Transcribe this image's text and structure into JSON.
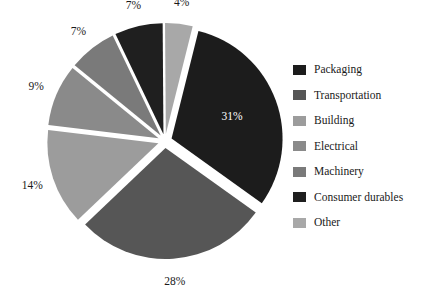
{
  "chart_data": {
    "type": "pie",
    "title": "",
    "subtitle": "",
    "xlabel": "",
    "ylabel": "",
    "legend_position": "right",
    "grid": false,
    "exploded": true,
    "background": "#ffffff",
    "categories": [
      "Packaging",
      "Transportation",
      "Building",
      "Electrical",
      "Machinery",
      "Consumer durables",
      "Other"
    ],
    "values": [
      31,
      28,
      14,
      9,
      7,
      7,
      4
    ],
    "value_unit": "%",
    "data_labels": [
      "31%",
      "28%",
      "14%",
      "9%",
      "7%",
      "7%",
      "4%"
    ],
    "colors": [
      "#1c1c1c",
      "#565656",
      "#9c9c9c",
      "#8a8a8a",
      "#7a7a7a",
      "#1f1f1f",
      "#a8a8a8"
    ],
    "slices": [
      {
        "label": "Packaging",
        "value": 31,
        "display": "31%",
        "color": "#1c1c1c",
        "label_inside": true
      },
      {
        "label": "Transportation",
        "value": 28,
        "display": "28%",
        "color": "#565656",
        "label_inside": false
      },
      {
        "label": "Building",
        "value": 14,
        "display": "14%",
        "color": "#9c9c9c",
        "label_inside": false
      },
      {
        "label": "Electrical",
        "value": 9,
        "display": "9%",
        "color": "#8a8a8a",
        "label_inside": false
      },
      {
        "label": "Machinery",
        "value": 7,
        "display": "7%",
        "color": "#7a7a7a",
        "label_inside": false
      },
      {
        "label": "Consumer durables",
        "value": 7,
        "display": "7%",
        "color": "#1f1f1f",
        "label_inside": false
      },
      {
        "label": "Other",
        "value": 4,
        "display": "4%",
        "color": "#a8a8a8",
        "label_inside": false
      }
    ]
  },
  "legend": {
    "items": [
      {
        "label": "Packaging",
        "color": "#1c1c1c"
      },
      {
        "label": "Transportation",
        "color": "#565656"
      },
      {
        "label": "Building",
        "color": "#9c9c9c"
      },
      {
        "label": "Electrical",
        "color": "#8a8a8a"
      },
      {
        "label": "Machinery",
        "color": "#7a7a7a"
      },
      {
        "label": "Consumer durables",
        "color": "#1f1f1f"
      },
      {
        "label": "Other",
        "color": "#a8a8a8"
      }
    ]
  }
}
